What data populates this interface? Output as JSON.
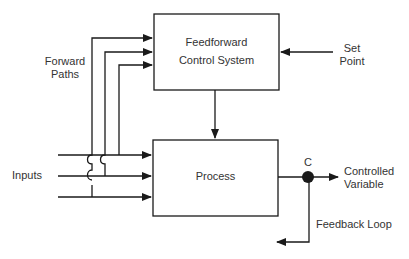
{
  "diagram": {
    "blocks": {
      "feedforward": {
        "line1": "Feedforward",
        "line2": "Control System"
      },
      "process": {
        "label": "Process"
      }
    },
    "labels": {
      "forward_paths_1": "Forward",
      "forward_paths_2": "Paths",
      "set_point_1": "Set",
      "set_point_2": "Point",
      "inputs": "Inputs",
      "junction": "C",
      "controlled_variable_1": "Controlled",
      "controlled_variable_2": "Variable",
      "feedback_loop": "Feedback Loop"
    },
    "colors": {
      "line": "#1a1a1a",
      "text": "#333333",
      "background": "#ffffff"
    }
  }
}
